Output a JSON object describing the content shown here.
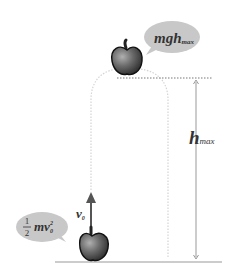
{
  "diagram": {
    "type": "energy-conservation-vertical-throw",
    "top_bubble": {
      "text_main": "mgh",
      "text_sub": "max"
    },
    "bottom_bubble": {
      "fraction_numerator": "1",
      "fraction_denominator": "2",
      "text_main": "mv",
      "text_sub": "0",
      "text_sup": "2"
    },
    "velocity_label": {
      "text_main": "v",
      "text_sub": "0"
    },
    "height_label": {
      "text_main": "h",
      "text_sub": "max"
    },
    "colors": {
      "bubble_fill": "#c8c8c8",
      "apple_dark": "#2a2a2a",
      "apple_light": "#9a9a9a",
      "arrow": "#555555",
      "trajectory": "#d0d0d0",
      "ground": "#cccccc",
      "dotted_line": "#777777"
    }
  }
}
